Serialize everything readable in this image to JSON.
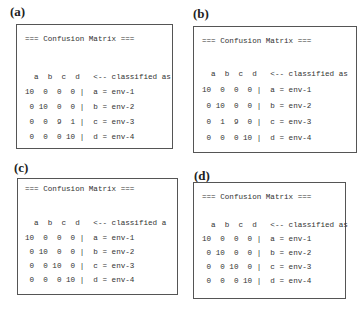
{
  "panels": [
    {
      "label": "(a)",
      "title": "=== Confusion Matrix ===",
      "header": "  a  b  c  d   <-- classified as",
      "rows": [
        "10  0  0  0 |  a = env-1",
        " 0 10  0  0 |  b = env-2",
        " 0  0  9  1 |  c = env-3",
        " 0  0  0 10 |  d = env-4"
      ],
      "matrix": [
        [
          10,
          0,
          0,
          0
        ],
        [
          0,
          10,
          0,
          0
        ],
        [
          0,
          0,
          9,
          1
        ],
        [
          0,
          0,
          0,
          10
        ]
      ]
    },
    {
      "label": "(b)",
      "title": "=== Confusion Matrix ===",
      "header": "  a  b  c  d   <-- classified as",
      "rows": [
        "10  0  0  0 |  a = env-1",
        " 0 10  0  0 |  b = env-2",
        " 0  1  9  0 |  c = env-3",
        " 0  0  0 10 |  d = env-4"
      ],
      "matrix": [
        [
          10,
          0,
          0,
          0
        ],
        [
          0,
          10,
          0,
          0
        ],
        [
          0,
          1,
          9,
          0
        ],
        [
          0,
          0,
          0,
          10
        ]
      ]
    },
    {
      "label": "(c)",
      "title": "=== Confusion Matrix ===",
      "header": "  a  b  c  d   <-- classified a",
      "rows": [
        "10  0  0  0 |  a = env-1",
        " 0 10  0  0 |  b = env-2",
        " 0  0 10  0 |  c = env-3",
        " 0  0  0 10 |  d = env-4"
      ],
      "matrix": [
        [
          10,
          0,
          0,
          0
        ],
        [
          0,
          10,
          0,
          0
        ],
        [
          0,
          0,
          10,
          0
        ],
        [
          0,
          0,
          0,
          10
        ]
      ]
    },
    {
      "label": "(d)",
      "title": "=== Confusion Matrix ===",
      "header": "  a  b  c  d   <-- classified as",
      "rows": [
        "10  0  0  0 |  a = env-1",
        " 0 10  0  0 |  b = env-2",
        " 0  0 10  0 |  c = env-3",
        " 0  0  0 10 |  d = env-4"
      ],
      "matrix": [
        [
          10,
          0,
          0,
          0
        ],
        [
          0,
          10,
          0,
          0
        ],
        [
          0,
          0,
          10,
          0
        ],
        [
          0,
          0,
          0,
          10
        ]
      ]
    }
  ]
}
